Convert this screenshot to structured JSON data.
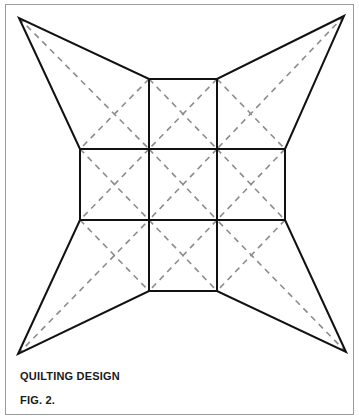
{
  "figure": {
    "title": "QUILTING DESIGN",
    "label": "FIG. 2.",
    "colors": {
      "outline": "#111111",
      "dashed": "#8c8c8c",
      "border": "#9a9a9a"
    }
  }
}
